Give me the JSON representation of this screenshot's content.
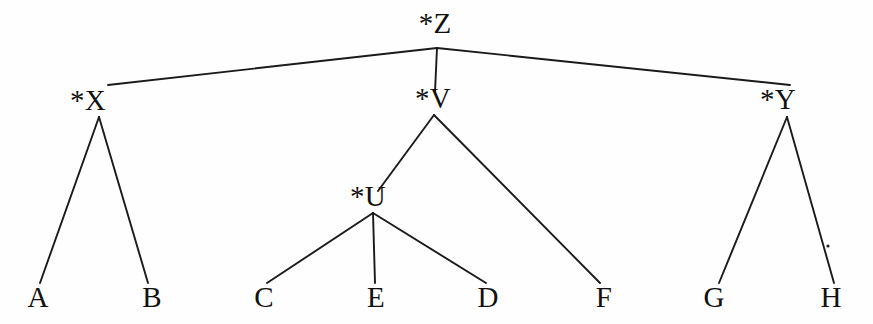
{
  "diagram": {
    "type": "tree",
    "background_color": "#fefefe",
    "line_color": "#1a1a1a",
    "text_color": "#111111",
    "root": "*Z",
    "nodes": [
      {
        "id": "Z",
        "label": "*Z",
        "kind": "internal",
        "x": 435,
        "y": 33,
        "anchor_x": 437,
        "anchor_y": 48
      },
      {
        "id": "X",
        "label": "*X",
        "kind": "internal",
        "x": 88,
        "y": 110,
        "anchor_x": 99,
        "anchor_y": 117
      },
      {
        "id": "V",
        "label": "*V",
        "kind": "internal",
        "x": 433,
        "y": 108,
        "anchor_x": 434,
        "anchor_y": 115
      },
      {
        "id": "Y",
        "label": "*Y",
        "kind": "internal",
        "x": 778,
        "y": 109,
        "anchor_x": 787,
        "anchor_y": 117
      },
      {
        "id": "U",
        "label": "*U",
        "kind": "internal",
        "x": 368,
        "y": 206,
        "anchor_x": 373,
        "anchor_y": 213
      },
      {
        "id": "A",
        "label": "A",
        "kind": "leaf",
        "x": 38,
        "y": 307,
        "anchor_x": 40,
        "anchor_y": 283
      },
      {
        "id": "B",
        "label": "B",
        "kind": "leaf",
        "x": 152,
        "y": 307,
        "anchor_x": 148,
        "anchor_y": 283
      },
      {
        "id": "C",
        "label": "C",
        "kind": "leaf",
        "x": 264,
        "y": 307,
        "anchor_x": 267,
        "anchor_y": 283
      },
      {
        "id": "E",
        "label": "E",
        "kind": "leaf",
        "x": 376,
        "y": 307,
        "anchor_x": 375,
        "anchor_y": 283
      },
      {
        "id": "D",
        "label": "D",
        "kind": "leaf",
        "x": 488,
        "y": 307,
        "anchor_x": 486,
        "anchor_y": 283
      },
      {
        "id": "F",
        "label": "F",
        "kind": "leaf",
        "x": 604,
        "y": 307,
        "anchor_x": 600,
        "anchor_y": 283
      },
      {
        "id": "G",
        "label": "G",
        "kind": "leaf",
        "x": 714,
        "y": 307,
        "anchor_x": 719,
        "anchor_y": 283
      },
      {
        "id": "H",
        "label": "H",
        "kind": "leaf",
        "x": 831,
        "y": 307,
        "anchor_x": 834,
        "anchor_y": 283
      }
    ],
    "edges": [
      {
        "id": "edge-z-x",
        "from": "Z",
        "to": "X",
        "x1": 437,
        "y1": 48,
        "x2": 108,
        "y2": 85
      },
      {
        "id": "edge-z-v",
        "from": "Z",
        "to": "V",
        "x1": 437,
        "y1": 48,
        "x2": 435,
        "y2": 92
      },
      {
        "id": "edge-z-y",
        "from": "Z",
        "to": "Y",
        "x1": 437,
        "y1": 48,
        "x2": 790,
        "y2": 85
      },
      {
        "id": "edge-x-a",
        "from": "X",
        "to": "A",
        "x1": 99,
        "y1": 117,
        "x2": 40,
        "y2": 283
      },
      {
        "id": "edge-x-b",
        "from": "X",
        "to": "B",
        "x1": 99,
        "y1": 117,
        "x2": 148,
        "y2": 283
      },
      {
        "id": "edge-v-u",
        "from": "V",
        "to": "U",
        "x1": 434,
        "y1": 115,
        "x2": 378,
        "y2": 191
      },
      {
        "id": "edge-v-f",
        "from": "V",
        "to": "F",
        "x1": 434,
        "y1": 115,
        "x2": 600,
        "y2": 283
      },
      {
        "id": "edge-u-c",
        "from": "U",
        "to": "C",
        "x1": 373,
        "y1": 213,
        "x2": 267,
        "y2": 283
      },
      {
        "id": "edge-u-e",
        "from": "U",
        "to": "E",
        "x1": 373,
        "y1": 213,
        "x2": 375,
        "y2": 283
      },
      {
        "id": "edge-u-d",
        "from": "U",
        "to": "D",
        "x1": 373,
        "y1": 213,
        "x2": 486,
        "y2": 283
      },
      {
        "id": "edge-y-g",
        "from": "Y",
        "to": "G",
        "x1": 787,
        "y1": 117,
        "x2": 719,
        "y2": 283
      },
      {
        "id": "edge-y-h",
        "from": "Y",
        "to": "H",
        "x1": 787,
        "y1": 117,
        "x2": 834,
        "y2": 283
      }
    ],
    "artifacts": [
      {
        "id": "speck-1",
        "x": 828,
        "y": 246,
        "r": 1.6
      }
    ]
  }
}
